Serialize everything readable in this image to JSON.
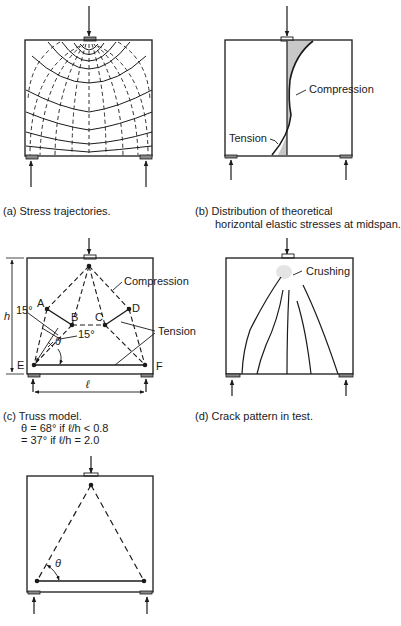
{
  "panels": {
    "a": {
      "caption": "(a)  Stress trajectories."
    },
    "b": {
      "caption_line1": "(b)  Distribution of theoretical",
      "caption_line2": "horizontal elastic stresses at midspan.",
      "label_compression": "Compression",
      "label_tension": "Tension"
    },
    "c": {
      "caption_line1": "(c)  Truss model.",
      "caption_line2": "θ = 68° if ℓ/h < 0.8",
      "caption_line3": "= 37° if ℓ/h = 2.0",
      "label_compression": "Compression",
      "label_tension": "Tension",
      "node_A": "A",
      "node_B": "B",
      "node_C": "C",
      "node_D": "D",
      "node_E": "E",
      "node_F": "F",
      "angle_top": "15°",
      "angle_mid": "15°",
      "theta": "θ",
      "height_label": "h",
      "span_label": "ℓ"
    },
    "d": {
      "caption": "(d)  Crack pattern in test.",
      "label_crushing": "Crushing"
    },
    "e": {
      "theta": "θ"
    }
  },
  "colors": {
    "ink": "#1a1a1a",
    "shade": "#c8c8c8",
    "background": "#ffffff"
  }
}
